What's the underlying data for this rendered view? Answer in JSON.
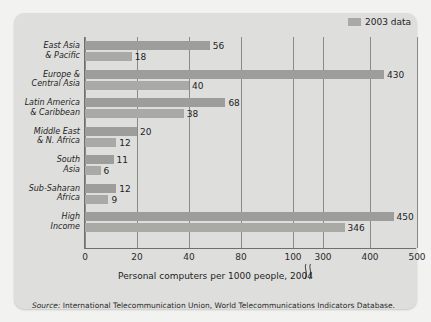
{
  "legend": {
    "label": "2003 data",
    "swatch_color": "#a9a9a6"
  },
  "axis_title": "Personal computers per 1000 people, 2004",
  "source_prefix": "Source:",
  "source_text": " International Telecommunication Union, World Telecommunications Indicators Database.",
  "colors": {
    "bar_2004": "#9d9d9b",
    "bar_2003": "#a9a9a6",
    "panel": "#dededc",
    "page": "#f2f2f0",
    "axis": "#6f6f6f"
  },
  "axis": {
    "ticks": [
      "0",
      "20",
      "40",
      "80",
      "100",
      "300",
      "400",
      "500"
    ],
    "break_between": [
      "100",
      "300"
    ]
  },
  "chart_data": {
    "type": "bar",
    "orientation": "horizontal",
    "title": "",
    "xlabel": "Personal computers per 1000 people, 2004",
    "ylabel": "",
    "categories": [
      "East Asia & Pacific",
      "Europe & Central Asia",
      "Latin America & Caribbean",
      "Middle East & N. Africa",
      "South Asia",
      "Sub-Saharan Africa",
      "High Income"
    ],
    "category_lines": [
      [
        "East Asia",
        "& Pacific"
      ],
      [
        "Europe &",
        "Central Asia"
      ],
      [
        "Latin America",
        "& Caribbean"
      ],
      [
        "Middle East",
        "& N. Africa"
      ],
      [
        "South",
        "Asia"
      ],
      [
        "Sub-Saharan",
        "Africa"
      ],
      [
        "High",
        "Income"
      ]
    ],
    "series": [
      {
        "name": "2004",
        "values": [
          56,
          430,
          68,
          20,
          11,
          12,
          450
        ]
      },
      {
        "name": "2003 data",
        "values": [
          18,
          40,
          38,
          12,
          6,
          9,
          346
        ]
      }
    ],
    "xlim": [
      0,
      500
    ],
    "xticks": [
      0,
      20,
      40,
      80,
      100,
      300,
      400,
      500
    ],
    "grid": true,
    "legend_position": "top-right",
    "axis_break": true,
    "annotations": [
      "Axis is non-linear: a break symbol sits between 100 and 300"
    ]
  }
}
